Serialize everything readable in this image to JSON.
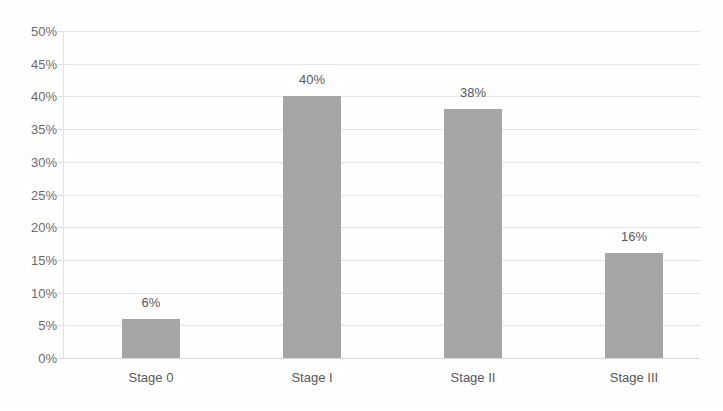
{
  "chart_data": {
    "type": "bar",
    "title": "",
    "title_note": "title row is cropped off the top edge of the screenshot and is illegible",
    "categories": [
      "Stage 0",
      "Stage I",
      "Stage II",
      "Stage III"
    ],
    "values": [
      6,
      40,
      38,
      16
    ],
    "data_labels": [
      "6%",
      "40%",
      "38%",
      "16%"
    ],
    "xlabel": "",
    "ylabel": "",
    "ylim": [
      0,
      50
    ],
    "ytick_step": 5,
    "yticks": [
      "0%",
      "5%",
      "10%",
      "15%",
      "20%",
      "25%",
      "30%",
      "35%",
      "40%",
      "45%",
      "50%"
    ],
    "ytick_values": [
      0,
      5,
      10,
      15,
      20,
      25,
      30,
      35,
      40,
      45,
      50
    ],
    "grid": true,
    "grid_axis": "y",
    "legend": false,
    "legend_position": "none",
    "series": [
      {
        "name": "Percent of patients",
        "values": [
          6,
          40,
          38,
          16
        ]
      }
    ]
  },
  "colors": {
    "bar_fill": "#a6a6a6",
    "gridline": "#e6e6e6",
    "baseline": "#d9d9d9",
    "axis_line": "#e2e2e2",
    "tick_label": "#6b6b6b",
    "data_label": "#595959",
    "category_label": "#595959",
    "background": "#ffffff"
  }
}
